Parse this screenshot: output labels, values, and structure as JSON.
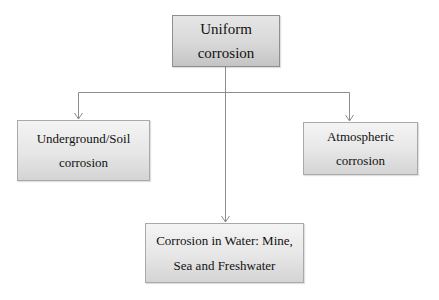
{
  "diagram": {
    "root": {
      "line1": "Uniform",
      "line2": "corrosion"
    },
    "children": [
      {
        "id": "left",
        "line1": "Underground/Soil",
        "line2": "corrosion"
      },
      {
        "id": "right",
        "line1": "Atmospheric",
        "line2": "corrosion"
      },
      {
        "id": "bottom",
        "line1": "Corrosion in Water: Mine,",
        "line2": "Sea and Freshwater"
      }
    ],
    "edges": [
      {
        "from": "root",
        "to": "left"
      },
      {
        "from": "root",
        "to": "right"
      },
      {
        "from": "root",
        "to": "bottom"
      }
    ],
    "colors": {
      "box_border": "#a9a9a9",
      "box_fill_top": "#f4f4f4",
      "box_fill_bottom": "#d4d4d4",
      "connector": "#8c8c8c",
      "text": "#111111"
    }
  }
}
